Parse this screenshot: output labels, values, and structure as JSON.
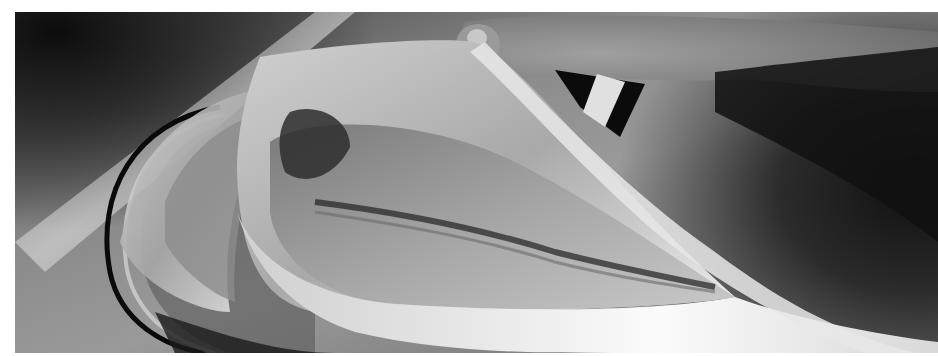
{
  "image": {
    "description": "Grayscale photo of a hand lifting a translucent fish skin/carcass over a stainless steel sink drain",
    "palette": {
      "dark": "#0c0c0c",
      "steel": "#8a8a8a",
      "highlight": "#f2f2f2",
      "flesh": "#b8b8b8",
      "border": "#ffffff"
    }
  }
}
